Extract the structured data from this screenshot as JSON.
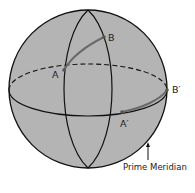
{
  "diagram": {
    "colors": {
      "sphere_fill": "#b4b4b4",
      "line": "#111111",
      "arc": "#6a6a6a",
      "background": "#ffffff"
    },
    "labels": {
      "point_a": "A",
      "point_b": "B",
      "point_a_prime": "A′",
      "point_b_prime": "B′",
      "prime_meridian": "Prime Meridian"
    }
  }
}
